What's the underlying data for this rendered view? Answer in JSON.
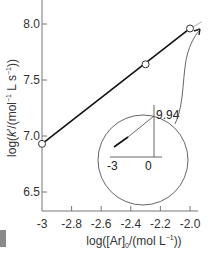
{
  "chart_data": {
    "type": "line",
    "title": "",
    "xlabel": "log([Ar]0/(mol L^-1))",
    "ylabel": "log(k'/(mol^-1 L s^-1))",
    "xlim": [
      -3.0,
      -1.95
    ],
    "ylim": [
      6.35,
      8.2
    ],
    "x_ticks": [
      -3,
      -2.8,
      -2.6,
      -2.4,
      -2.2,
      -2.0
    ],
    "x_tick_labels": [
      "-3",
      "-2.8",
      "-2.6",
      "-2.4",
      "-2.2",
      "-2.0"
    ],
    "y_ticks": [
      6.5,
      7.0,
      7.5,
      8.0
    ],
    "y_tick_labels": [
      "6.5",
      "7.0",
      "7.5",
      "8.0"
    ],
    "grid": false,
    "legend": null,
    "series": [
      {
        "name": "data",
        "marker": "open-circle",
        "x": [
          -3.0,
          -2.3,
          -2.0
        ],
        "y": [
          6.93,
          7.64,
          7.96
        ]
      }
    ],
    "fit_line": {
      "x": [
        -3.0,
        -1.92
      ],
      "y": [
        6.93,
        8.02
      ]
    },
    "inset": {
      "description": "Circular inset showing extrapolated fit line from x=-3 to x=0 with intercept 9.94",
      "x_tick_labels": [
        "-3",
        "0"
      ],
      "intercept_label": "9.94",
      "intercept_value": 9.94
    },
    "annotations": [
      "arrow from inset to upper end of fit line"
    ]
  },
  "labels": {
    "y_axis": {
      "prefix": "log(",
      "k": "k",
      "prime": "′",
      "mid": "/(mol",
      "exp1": "−1",
      "mid2": " L s",
      "exp2": "−1",
      "suffix": "))"
    },
    "x_axis": {
      "prefix": "log([Ar]",
      "sub": "0",
      "mid": "/(mol L",
      "exp": "−1",
      "suffix": "))"
    }
  }
}
